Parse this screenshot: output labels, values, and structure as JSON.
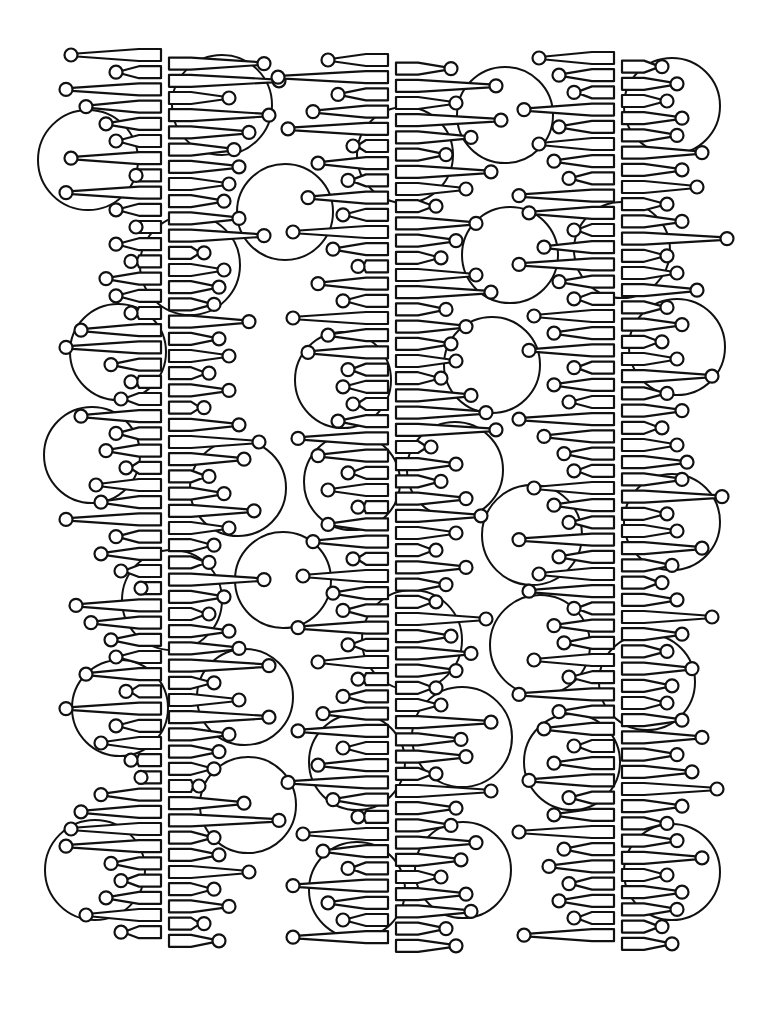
{
  "artwork": {
    "title": "Line-art coloring page: three lollipop-rung spines with overlapping circles",
    "background": "#ffffff",
    "stroke_color": "#111111",
    "rung_spacing": 17.2,
    "spines": [
      {
        "name": "left-spine",
        "x": 165,
        "y_start": 55,
        "left_lengths": [
          90,
          45,
          95,
          75,
          55,
          45,
          90,
          25,
          95,
          45,
          25,
          45,
          30,
          55,
          45,
          30,
          80,
          95,
          50,
          30,
          40,
          80,
          45,
          55,
          35,
          65,
          60,
          95,
          45,
          60,
          40,
          20,
          85,
          70,
          50,
          45,
          75,
          35,
          95,
          45,
          60,
          30,
          20,
          60,
          80,
          90,
          95,
          50,
          40,
          55,
          75,
          40
        ],
        "right_lengths": [
          95,
          110,
          60,
          100,
          80,
          65,
          70,
          60,
          55,
          70,
          95,
          35,
          55,
          50,
          45,
          80,
          50,
          60,
          40,
          60,
          35,
          70,
          90,
          75,
          40,
          55,
          85,
          60,
          45,
          40,
          95,
          55,
          40,
          60,
          70,
          100,
          45,
          70,
          100,
          60,
          50,
          45,
          30,
          75,
          110,
          45,
          50,
          80,
          45,
          60,
          35,
          50
        ]
      },
      {
        "name": "middle-spine",
        "x": 392,
        "y_start": 60,
        "left_lengths": [
          60,
          110,
          50,
          75,
          100,
          35,
          70,
          40,
          80,
          45,
          95,
          55,
          30,
          70,
          45,
          95,
          60,
          80,
          40,
          45,
          35,
          50,
          90,
          70,
          40,
          60,
          30,
          60,
          75,
          35,
          85,
          55,
          45,
          90,
          40,
          70,
          30,
          45,
          65,
          90,
          45,
          70,
          100,
          55,
          30,
          85,
          65,
          40,
          95,
          60,
          45,
          95
        ],
        "right_lengths": [
          55,
          100,
          60,
          105,
          75,
          50,
          95,
          70,
          40,
          80,
          60,
          45,
          80,
          95,
          50,
          70,
          55,
          60,
          45,
          75,
          90,
          100,
          35,
          60,
          45,
          70,
          85,
          60,
          40,
          70,
          50,
          40,
          90,
          55,
          75,
          60,
          40,
          45,
          95,
          65,
          70,
          40,
          95,
          60,
          55,
          80,
          65,
          45,
          70,
          75,
          50,
          60
        ]
      },
      {
        "name": "right-spine",
        "x": 618,
        "y_start": 58,
        "left_lengths": [
          75,
          55,
          40,
          90,
          55,
          75,
          60,
          45,
          95,
          85,
          40,
          70,
          95,
          55,
          40,
          80,
          60,
          85,
          40,
          60,
          45,
          95,
          70,
          50,
          40,
          80,
          60,
          45,
          95,
          55,
          75,
          85,
          40,
          60,
          50,
          80,
          45,
          95,
          55,
          70,
          40,
          60,
          85,
          45,
          60,
          95,
          50,
          65,
          45,
          55,
          40,
          90
        ],
        "right_lengths": [
          40,
          55,
          45,
          60,
          55,
          80,
          60,
          75,
          45,
          60,
          105,
          45,
          55,
          75,
          45,
          60,
          40,
          55,
          90,
          45,
          60,
          40,
          55,
          65,
          60,
          100,
          45,
          55,
          80,
          50,
          40,
          55,
          90,
          60,
          45,
          70,
          50,
          45,
          60,
          80,
          55,
          70,
          95,
          60,
          45,
          55,
          80,
          45,
          60,
          55,
          40,
          50
        ]
      }
    ],
    "circles": [
      {
        "cx": 88,
        "cy": 160,
        "r": 50
      },
      {
        "cx": 222,
        "cy": 105,
        "r": 50
      },
      {
        "cx": 190,
        "cy": 265,
        "r": 50
      },
      {
        "cx": 118,
        "cy": 352,
        "r": 48
      },
      {
        "cx": 92,
        "cy": 455,
        "r": 48
      },
      {
        "cx": 238,
        "cy": 488,
        "r": 48
      },
      {
        "cx": 172,
        "cy": 600,
        "r": 50
      },
      {
        "cx": 120,
        "cy": 708,
        "r": 48
      },
      {
        "cx": 245,
        "cy": 697,
        "r": 48
      },
      {
        "cx": 248,
        "cy": 805,
        "r": 48
      },
      {
        "cx": 95,
        "cy": 870,
        "r": 50
      },
      {
        "cx": 285,
        "cy": 212,
        "r": 48
      },
      {
        "cx": 405,
        "cy": 155,
        "r": 48
      },
      {
        "cx": 343,
        "cy": 380,
        "r": 48
      },
      {
        "cx": 352,
        "cy": 482,
        "r": 48
      },
      {
        "cx": 455,
        "cy": 470,
        "r": 48
      },
      {
        "cx": 283,
        "cy": 580,
        "r": 48
      },
      {
        "cx": 412,
        "cy": 640,
        "r": 50
      },
      {
        "cx": 357,
        "cy": 762,
        "r": 48
      },
      {
        "cx": 462,
        "cy": 737,
        "r": 50
      },
      {
        "cx": 357,
        "cy": 890,
        "r": 48
      },
      {
        "cx": 463,
        "cy": 870,
        "r": 48
      },
      {
        "cx": 505,
        "cy": 115,
        "r": 48
      },
      {
        "cx": 510,
        "cy": 255,
        "r": 48
      },
      {
        "cx": 492,
        "cy": 365,
        "r": 48
      },
      {
        "cx": 622,
        "cy": 250,
        "r": 48
      },
      {
        "cx": 672,
        "cy": 106,
        "r": 48
      },
      {
        "cx": 677,
        "cy": 347,
        "r": 48
      },
      {
        "cx": 532,
        "cy": 535,
        "r": 50
      },
      {
        "cx": 672,
        "cy": 522,
        "r": 48
      },
      {
        "cx": 540,
        "cy": 645,
        "r": 50
      },
      {
        "cx": 647,
        "cy": 682,
        "r": 48
      },
      {
        "cx": 572,
        "cy": 762,
        "r": 48
      },
      {
        "cx": 672,
        "cy": 872,
        "r": 48
      }
    ]
  }
}
